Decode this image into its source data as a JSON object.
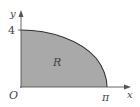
{
  "diagram": {
    "title": "",
    "axes": {
      "x_label": "x",
      "y_label": "y",
      "origin_label": "O",
      "x_tick_label": "π",
      "y_tick_label": "4"
    },
    "region": {
      "label": "R",
      "fill_color": "#a9a9a9",
      "curve": "y = 4cos(x/2)",
      "x_range": [
        0,
        3.14159
      ],
      "y_intercept": 4
    },
    "colors": {
      "axis": "#555555",
      "curve": "#333333",
      "text": "#444444"
    }
  }
}
